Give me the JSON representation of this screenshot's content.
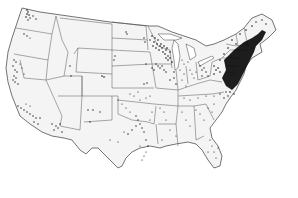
{
  "map": {
    "title": "Dot-density map of the contiguous United States",
    "type": "dot-density",
    "region": "Contiguous United States",
    "colors": {
      "background": "#ffffff",
      "land": "#f4f4f4",
      "border": "#3a3a3a",
      "dot": "#111111"
    },
    "density_regions": [
      {
        "name": "Northeast corridor (Boston–New York–Philadelphia–Washington)",
        "level": "very high"
      },
      {
        "name": "Upper Midwest (Minnesota–Wisconsin–Iowa)",
        "level": "high"
      },
      {
        "name": "Ohio Valley / Great Lakes",
        "level": "medium"
      },
      {
        "name": "Pacific coast (Puget Sound, California)",
        "level": "low-medium"
      },
      {
        "name": "Texas and Florida",
        "level": "low-medium"
      },
      {
        "name": "Mountain West and Great Plains",
        "level": "sparse"
      }
    ],
    "labels": []
  }
}
